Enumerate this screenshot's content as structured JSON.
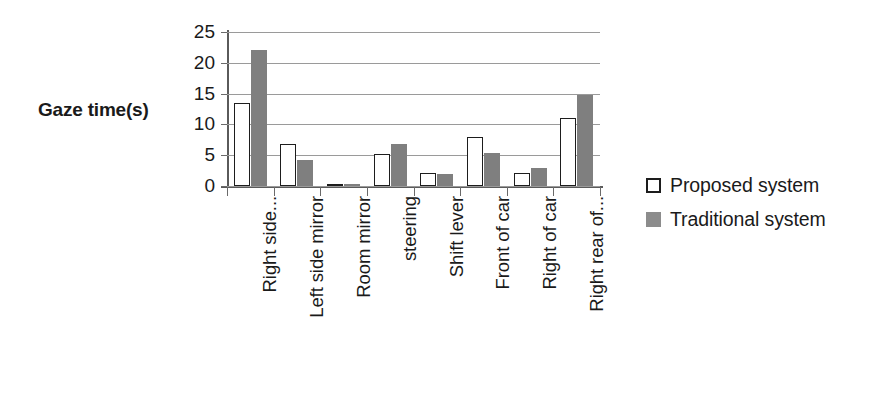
{
  "chart_data": {
    "type": "bar",
    "title": "",
    "xlabel": "",
    "ylabel": "Gaze time(s)",
    "ylim": [
      0,
      25
    ],
    "y_ticks": [
      0,
      5,
      10,
      15,
      20,
      25
    ],
    "grid": true,
    "legend_position": "right",
    "categories": [
      "Right side...",
      "Left side mirror",
      "Room mirror",
      "steering",
      "Shift lever",
      "Front of car",
      "Right of car",
      "Right rear of..."
    ],
    "series": [
      {
        "name": "Proposed system",
        "color": "#ffffff",
        "edge_color": "#1d1d1d",
        "values": [
          13.5,
          6.8,
          0.4,
          5.2,
          2.1,
          7.9,
          2.1,
          11.0
        ]
      },
      {
        "name": "Traditional system",
        "color": "#7f7f7f",
        "edge_color": "#7f7f7f",
        "values": [
          22.0,
          4.2,
          0.4,
          6.8,
          2.0,
          5.4,
          2.9,
          14.8
        ]
      }
    ]
  },
  "legend": {
    "items": [
      {
        "label": "Proposed system",
        "swatch": "hollow-square-marker"
      },
      {
        "label": "Traditional system",
        "swatch": "filled-square-marker"
      }
    ]
  },
  "colors": {
    "traditional_gray": "#7f7f7f",
    "axis": "#5a5a5a",
    "gridline": "#9a9a9a",
    "text": "#1a1a1a"
  }
}
